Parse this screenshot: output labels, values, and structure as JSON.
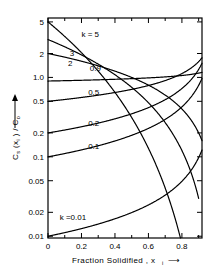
{
  "chart_data": {
    "type": "line",
    "title": "",
    "xlabel": "Fraction Solidified, xᵢ",
    "ylabel": "Cₛ (xᵢ) / Cₒ",
    "xlabel_plain": "Fraction Solidified , x",
    "xlabel_sub": "i",
    "ylabel_main": "C",
    "ylabel_sub1": "s",
    "ylabel_mid": " (x",
    "ylabel_sub2": "i",
    "ylabel_tail": " ) / C",
    "ylabel_sub3": "o",
    "xscale": "linear",
    "yscale": "log",
    "xlim": [
      0,
      0.92
    ],
    "ylim": [
      0.0095,
      5.6
    ],
    "grid": false,
    "legend": "inline-curve-labels",
    "x_ticks_major": [
      0,
      0.2,
      0.4,
      0.6,
      0.8
    ],
    "x_ticklabels": [
      "0",
      "0.2",
      "0.4",
      "0.6",
      "0.8"
    ],
    "x_ticks_minor": [
      0.1,
      0.3,
      0.5,
      0.7,
      0.9
    ],
    "y_ticks_major": [
      5,
      2,
      1.0,
      0.5,
      0.2,
      0.1,
      0.05,
      0.02,
      0.01
    ],
    "y_ticklabels": [
      "5",
      "2",
      "1.0",
      "0.5",
      "0.2",
      "0.1",
      "0.05",
      "0.02",
      "0.01"
    ],
    "equation": "Cs/C0 = k (1 - x)^(k-1)",
    "series": [
      {
        "name": "k = 5",
        "k": 5,
        "label": "k = 5",
        "label_x": 0.2,
        "label_y": 3.55,
        "start_y": 5.0,
        "end_x": 0.8
      },
      {
        "name": "3",
        "k": 3,
        "label": "3",
        "label_x": 0.13,
        "label_y": 2.05,
        "start_y": 3.0,
        "end_x": 0.9
      },
      {
        "name": "2",
        "k": 2,
        "label": "2",
        "label_x": 0.12,
        "label_y": 1.52,
        "start_y": 2.0,
        "end_x": 0.92
      },
      {
        "name": "0.9",
        "k": 0.9,
        "label": "0.9",
        "label_x": 0.25,
        "label_y": 1.3,
        "start_y": 0.9,
        "end_x": 0.92
      },
      {
        "name": "0.5",
        "k": 0.5,
        "label": "0.5",
        "label_x": 0.24,
        "label_y": 0.66,
        "start_y": 0.5,
        "end_x": 0.92
      },
      {
        "name": "0.2",
        "k": 0.2,
        "label": "0.2",
        "label_x": 0.24,
        "label_y": 0.27,
        "start_y": 0.2,
        "end_x": 0.92
      },
      {
        "name": "0.1",
        "k": 0.1,
        "label": "0.1",
        "label_x": 0.24,
        "label_y": 0.135,
        "start_y": 0.1,
        "end_x": 0.92
      },
      {
        "name": "k = 0.01",
        "k": 0.01,
        "label": "k =0.01",
        "label_x": 0.07,
        "label_y": 0.0175,
        "start_y": 0.01,
        "end_x": 0.92
      }
    ],
    "colors": {
      "line": "#000000",
      "axis": "#000000",
      "background": "#ffffff"
    }
  },
  "axes": {
    "x_arrow": "⟶",
    "y_arrow": "↑"
  }
}
